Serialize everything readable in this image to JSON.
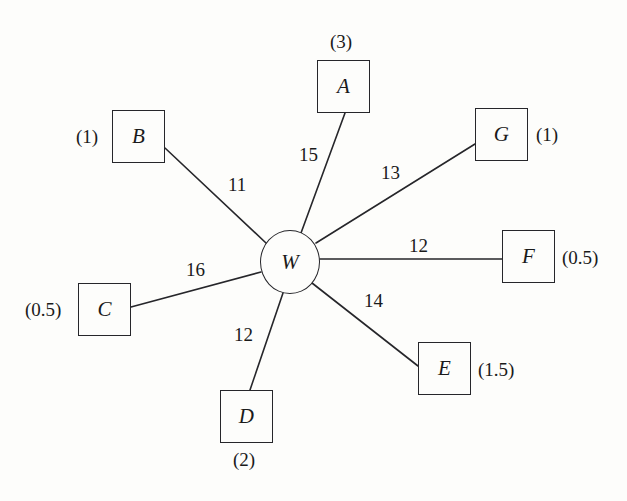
{
  "diagram": {
    "type": "star-graph",
    "background_color": "#fdfdfb",
    "line_color": "#26262a",
    "center": {
      "id": "W",
      "label": "W",
      "shape": "circle",
      "cx": 290,
      "cy": 262,
      "rx": 30,
      "ry": 32
    },
    "nodes": [
      {
        "id": "A",
        "label": "A",
        "shape": "square",
        "x": 317,
        "y": 60,
        "w": 53,
        "h": 53,
        "weight": "(3)",
        "weight_position": "above",
        "weight_x": 330,
        "weight_y": 32
      },
      {
        "id": "B",
        "label": "B",
        "shape": "square",
        "x": 112,
        "y": 110,
        "w": 53,
        "h": 53,
        "weight": "(1)",
        "weight_position": "left",
        "weight_x": 76,
        "weight_y": 127
      },
      {
        "id": "C",
        "label": "C",
        "shape": "square",
        "x": 78,
        "y": 283,
        "w": 53,
        "h": 53,
        "weight": "(0.5)",
        "weight_position": "left",
        "weight_x": 25,
        "weight_y": 300
      },
      {
        "id": "D",
        "label": "D",
        "shape": "square",
        "x": 220,
        "y": 390,
        "w": 53,
        "h": 53,
        "weight": "(2)",
        "weight_position": "below",
        "weight_x": 233,
        "weight_y": 450
      },
      {
        "id": "E",
        "label": "E",
        "shape": "square",
        "x": 418,
        "y": 342,
        "w": 53,
        "h": 53,
        "weight": "(1.5)",
        "weight_position": "right",
        "weight_x": 478,
        "weight_y": 360
      },
      {
        "id": "F",
        "label": "F",
        "shape": "square",
        "x": 502,
        "y": 230,
        "w": 53,
        "h": 53,
        "weight": "(0.5)",
        "weight_position": "right",
        "weight_x": 562,
        "weight_y": 248
      },
      {
        "id": "G",
        "label": "G",
        "shape": "square",
        "x": 475,
        "y": 108,
        "w": 53,
        "h": 53,
        "weight": "(1)",
        "weight_position": "right",
        "weight_x": 536,
        "weight_y": 125
      }
    ],
    "edges": [
      {
        "from": "W",
        "to": "A",
        "label": "15",
        "x1": 301,
        "y1": 233,
        "x2": 345,
        "y2": 113,
        "label_x": 299,
        "label_y": 145
      },
      {
        "from": "W",
        "to": "B",
        "label": "11",
        "x1": 266,
        "y1": 243,
        "x2": 165,
        "y2": 148,
        "label_x": 228,
        "label_y": 175
      },
      {
        "from": "W",
        "to": "C",
        "label": "16",
        "x1": 261,
        "y1": 272,
        "x2": 131,
        "y2": 307,
        "label_x": 186,
        "label_y": 260
      },
      {
        "from": "W",
        "to": "D",
        "label": "12",
        "x1": 283,
        "y1": 293,
        "x2": 250,
        "y2": 390,
        "label_x": 234,
        "label_y": 325
      },
      {
        "from": "W",
        "to": "E",
        "label": "14",
        "x1": 312,
        "y1": 283,
        "x2": 418,
        "y2": 366,
        "label_x": 364,
        "label_y": 291
      },
      {
        "from": "W",
        "to": "F",
        "label": "12",
        "x1": 320,
        "y1": 259,
        "x2": 502,
        "y2": 259,
        "label_x": 409,
        "label_y": 236
      },
      {
        "from": "W",
        "to": "G",
        "label": "13",
        "x1": 316,
        "y1": 243,
        "x2": 475,
        "y2": 144,
        "label_x": 381,
        "label_y": 163
      }
    ]
  }
}
